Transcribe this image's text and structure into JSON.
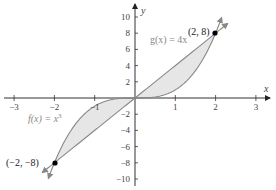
{
  "chart_data": {
    "type": "line",
    "title": "",
    "xlabel": "x",
    "ylabel": "y",
    "xlim": [
      -3,
      3
    ],
    "ylim": [
      -10,
      10
    ],
    "grid": false,
    "x_ticks": [
      -3,
      -2,
      -1,
      1,
      2,
      3
    ],
    "x_tick_labels": [
      "−3",
      "−2",
      "−1",
      "1",
      "2",
      "3"
    ],
    "y_ticks": [
      -10,
      -8,
      -6,
      -4,
      -2,
      2,
      4,
      6,
      8,
      10
    ],
    "y_tick_labels": [
      "−10",
      "−8",
      "−6",
      "−4",
      "−2",
      "2",
      "4",
      "6",
      "8",
      "10"
    ],
    "series": [
      {
        "name": "f(x) = x³",
        "expression": "x^3",
        "domain": [
          -2.15,
          2.15
        ],
        "color": "#888888"
      },
      {
        "name": "g(x) = 4x",
        "expression": "4x",
        "domain": [
          -2.3,
          2.3
        ],
        "color": "#888888"
      }
    ],
    "shaded_region": {
      "between": [
        "f",
        "g"
      ],
      "x_range": [
        -2,
        2
      ],
      "color": "#e6e6e6"
    },
    "points": [
      {
        "x": 2,
        "y": 8,
        "label": "(2, 8)"
      },
      {
        "x": -2,
        "y": -8,
        "label": "(−2, −8)"
      }
    ],
    "annotations": [
      {
        "text": "g(x) = 4x",
        "x": 0.95,
        "y": 7.2
      },
      {
        "text": "f(x) = x³",
        "x": -2.6,
        "y": -2.7
      }
    ]
  },
  "labels": {
    "x_axis": "x",
    "y_axis": "y",
    "g_label": "g(x) = 4x",
    "f_label_main": "f(x) = x",
    "f_label_exp": "3",
    "point_top": "(2, 8)",
    "point_bottom": "(−2, −8)"
  }
}
